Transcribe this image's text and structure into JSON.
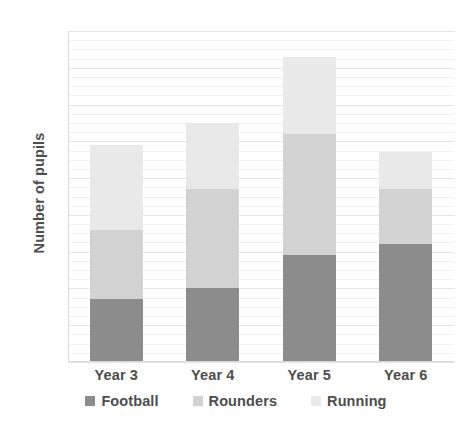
{
  "chart_data": {
    "type": "bar",
    "stacked": true,
    "title": "",
    "xlabel": "",
    "ylabel": "Number of pupils",
    "categories": [
      "Year 3",
      "Year 4",
      "Year 5",
      "Year 6"
    ],
    "series": [
      {
        "name": "Football",
        "values": [
          17,
          20,
          29,
          32
        ],
        "color": "#8c8c8c"
      },
      {
        "name": "Rounders",
        "values": [
          19,
          27,
          33,
          15
        ],
        "color": "#d2d2d2"
      },
      {
        "name": "Running",
        "values": [
          23,
          18,
          21,
          10
        ],
        "color": "#e9e9e9"
      }
    ],
    "stack_totals": [
      59,
      65,
      83,
      57
    ],
    "ylim": [
      0,
      90
    ],
    "y_tick_step": 10,
    "y_ticks": [
      "0",
      "10",
      "20",
      "30",
      "40",
      "50",
      "60",
      "70",
      "80",
      "90"
    ],
    "grid": "horizontal",
    "minor_gridlines": true,
    "legend_position": "bottom"
  },
  "legend": {
    "items": [
      {
        "label": "Football"
      },
      {
        "label": "Rounders"
      },
      {
        "label": "Running"
      }
    ]
  }
}
